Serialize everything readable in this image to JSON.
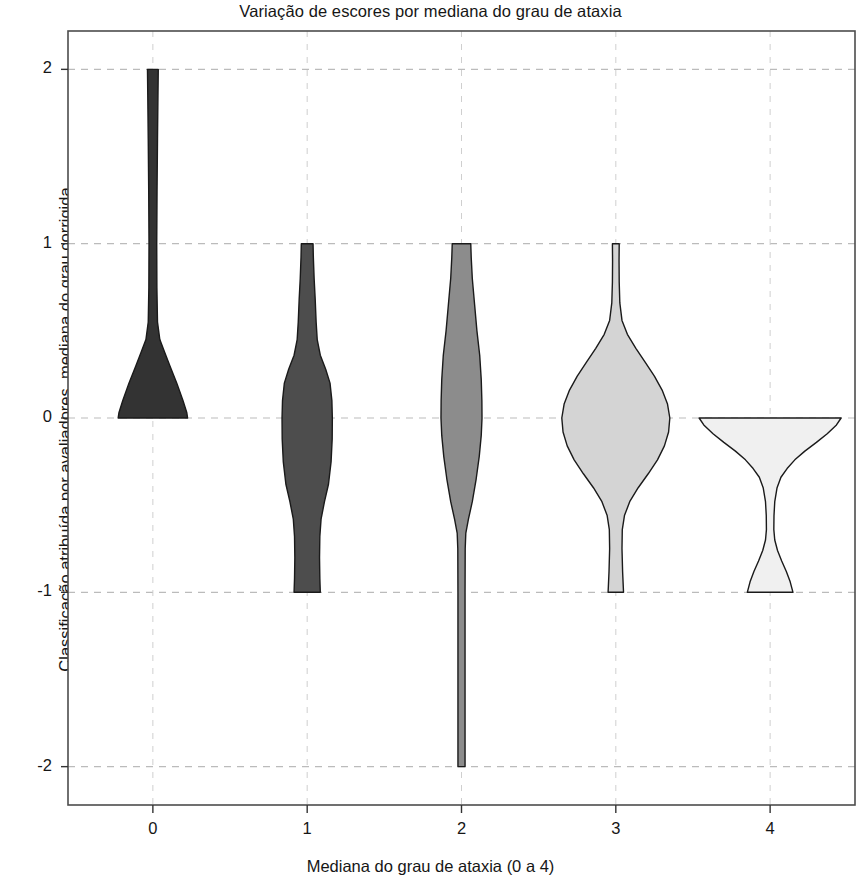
{
  "chart_data": {
    "type": "violin",
    "title": "Variação de escores por mediana do grau de ataxia",
    "xlabel": "Mediana do grau de ataxia (0 a 4)",
    "ylabel": "Classificação atribuída por avaliadores, mediana do grau corrigida",
    "categories": [
      "0",
      "1",
      "2",
      "3",
      "4"
    ],
    "x_tick_labels": [
      "0",
      "1",
      "2",
      "3",
      "4"
    ],
    "y_tick_labels": [
      "2",
      "1",
      "0",
      "-1",
      "-2"
    ],
    "y_tick_values": [
      2,
      1,
      0,
      -1,
      -2
    ],
    "xlim": [
      -0.55,
      4.55
    ],
    "ylim": [
      -2.22,
      2.22
    ],
    "grid": true,
    "grid_style": "dashed",
    "legend": "none",
    "series": [
      {
        "name": "Mediana 0",
        "category": "0",
        "center_x": 0,
        "fill_color": "#333333",
        "edge_color": "#1a1a1a",
        "data_min": 0,
        "data_max": 2,
        "median": 0,
        "density": [
          {
            "y": 2.0,
            "halfwidth": 0.035
          },
          {
            "y": 1.85,
            "halfwidth": 0.033
          },
          {
            "y": 1.6,
            "halfwidth": 0.03
          },
          {
            "y": 1.3,
            "halfwidth": 0.027
          },
          {
            "y": 1.0,
            "halfwidth": 0.025
          },
          {
            "y": 0.75,
            "halfwidth": 0.026
          },
          {
            "y": 0.55,
            "halfwidth": 0.03
          },
          {
            "y": 0.45,
            "halfwidth": 0.045
          },
          {
            "y": 0.38,
            "halfwidth": 0.075
          },
          {
            "y": 0.3,
            "halfwidth": 0.11
          },
          {
            "y": 0.2,
            "halfwidth": 0.155
          },
          {
            "y": 0.1,
            "halfwidth": 0.195
          },
          {
            "y": 0.03,
            "halfwidth": 0.22
          },
          {
            "y": 0.0,
            "halfwidth": 0.225
          }
        ]
      },
      {
        "name": "Mediana 1",
        "category": "1",
        "center_x": 1,
        "fill_color": "#4d4d4d",
        "edge_color": "#1a1a1a",
        "data_min": -1,
        "data_max": 1,
        "median": -0.1,
        "density": [
          {
            "y": 1.0,
            "halfwidth": 0.038
          },
          {
            "y": 0.92,
            "halfwidth": 0.04
          },
          {
            "y": 0.8,
            "halfwidth": 0.045
          },
          {
            "y": 0.68,
            "halfwidth": 0.052
          },
          {
            "y": 0.55,
            "halfwidth": 0.058
          },
          {
            "y": 0.45,
            "halfwidth": 0.065
          },
          {
            "y": 0.36,
            "halfwidth": 0.085
          },
          {
            "y": 0.28,
            "halfwidth": 0.12
          },
          {
            "y": 0.2,
            "halfwidth": 0.148
          },
          {
            "y": 0.1,
            "halfwidth": 0.16
          },
          {
            "y": 0.0,
            "halfwidth": 0.163
          },
          {
            "y": -0.12,
            "halfwidth": 0.162
          },
          {
            "y": -0.25,
            "halfwidth": 0.155
          },
          {
            "y": -0.38,
            "halfwidth": 0.138
          },
          {
            "y": -0.48,
            "halfwidth": 0.112
          },
          {
            "y": -0.58,
            "halfwidth": 0.09
          },
          {
            "y": -0.68,
            "halfwidth": 0.082
          },
          {
            "y": -0.8,
            "halfwidth": 0.08
          },
          {
            "y": -0.92,
            "halfwidth": 0.082
          },
          {
            "y": -1.0,
            "halfwidth": 0.085
          }
        ]
      },
      {
        "name": "Mediana 2",
        "category": "2",
        "center_x": 2,
        "fill_color": "#8c8c8c",
        "edge_color": "#1a1a1a",
        "data_min": -2,
        "data_max": 1,
        "median": 0,
        "density": [
          {
            "y": 1.0,
            "halfwidth": 0.06
          },
          {
            "y": 0.92,
            "halfwidth": 0.063
          },
          {
            "y": 0.8,
            "halfwidth": 0.07
          },
          {
            "y": 0.65,
            "halfwidth": 0.085
          },
          {
            "y": 0.5,
            "halfwidth": 0.1
          },
          {
            "y": 0.36,
            "halfwidth": 0.118
          },
          {
            "y": 0.22,
            "halfwidth": 0.128
          },
          {
            "y": 0.1,
            "halfwidth": 0.132
          },
          {
            "y": 0.0,
            "halfwidth": 0.133
          },
          {
            "y": -0.1,
            "halfwidth": 0.128
          },
          {
            "y": -0.22,
            "halfwidth": 0.115
          },
          {
            "y": -0.35,
            "halfwidth": 0.095
          },
          {
            "y": -0.48,
            "halfwidth": 0.07
          },
          {
            "y": -0.58,
            "halfwidth": 0.045
          },
          {
            "y": -0.66,
            "halfwidth": 0.028
          },
          {
            "y": -0.75,
            "halfwidth": 0.024
          },
          {
            "y": -1.0,
            "halfwidth": 0.023
          },
          {
            "y": -1.4,
            "halfwidth": 0.023
          },
          {
            "y": -1.8,
            "halfwidth": 0.023
          },
          {
            "y": -2.0,
            "halfwidth": 0.023
          }
        ]
      },
      {
        "name": "Mediana 3",
        "category": "3",
        "center_x": 3,
        "fill_color": "#d4d4d4",
        "edge_color": "#1a1a1a",
        "data_min": -1,
        "data_max": 1,
        "median": 0,
        "density": [
          {
            "y": 1.0,
            "halfwidth": 0.022
          },
          {
            "y": 0.9,
            "halfwidth": 0.021
          },
          {
            "y": 0.78,
            "halfwidth": 0.022
          },
          {
            "y": 0.66,
            "halfwidth": 0.026
          },
          {
            "y": 0.56,
            "halfwidth": 0.04
          },
          {
            "y": 0.48,
            "halfwidth": 0.075
          },
          {
            "y": 0.4,
            "halfwidth": 0.13
          },
          {
            "y": 0.32,
            "halfwidth": 0.19
          },
          {
            "y": 0.24,
            "halfwidth": 0.25
          },
          {
            "y": 0.16,
            "halfwidth": 0.3
          },
          {
            "y": 0.08,
            "halfwidth": 0.335
          },
          {
            "y": 0.0,
            "halfwidth": 0.35
          },
          {
            "y": -0.08,
            "halfwidth": 0.342
          },
          {
            "y": -0.16,
            "halfwidth": 0.315
          },
          {
            "y": -0.24,
            "halfwidth": 0.27
          },
          {
            "y": -0.32,
            "halfwidth": 0.21
          },
          {
            "y": -0.4,
            "halfwidth": 0.145
          },
          {
            "y": -0.48,
            "halfwidth": 0.09
          },
          {
            "y": -0.56,
            "halfwidth": 0.056
          },
          {
            "y": -0.64,
            "halfwidth": 0.042
          },
          {
            "y": -0.75,
            "halfwidth": 0.04
          },
          {
            "y": -0.88,
            "halfwidth": 0.044
          },
          {
            "y": -1.0,
            "halfwidth": 0.05
          }
        ]
      },
      {
        "name": "Mediana 4",
        "category": "4",
        "center_x": 4,
        "fill_color": "#f0f0f0",
        "edge_color": "#1a1a1a",
        "data_min": -1,
        "data_max": 0,
        "median": 0,
        "density": [
          {
            "y": 0.0,
            "halfwidth": 0.46
          },
          {
            "y": -0.04,
            "halfwidth": 0.43
          },
          {
            "y": -0.09,
            "halfwidth": 0.37
          },
          {
            "y": -0.14,
            "halfwidth": 0.3
          },
          {
            "y": -0.19,
            "halfwidth": 0.225
          },
          {
            "y": -0.24,
            "halfwidth": 0.16
          },
          {
            "y": -0.29,
            "halfwidth": 0.11
          },
          {
            "y": -0.34,
            "halfwidth": 0.07
          },
          {
            "y": -0.4,
            "halfwidth": 0.045
          },
          {
            "y": -0.48,
            "halfwidth": 0.03
          },
          {
            "y": -0.56,
            "halfwidth": 0.025
          },
          {
            "y": -0.64,
            "halfwidth": 0.024
          },
          {
            "y": -0.7,
            "halfwidth": 0.03
          },
          {
            "y": -0.76,
            "halfwidth": 0.048
          },
          {
            "y": -0.82,
            "halfwidth": 0.075
          },
          {
            "y": -0.88,
            "halfwidth": 0.105
          },
          {
            "y": -0.94,
            "halfwidth": 0.13
          },
          {
            "y": -1.0,
            "halfwidth": 0.148
          }
        ]
      }
    ]
  },
  "axes": {
    "frame_color": "#4d4d4d",
    "grid_color": "#bbbbbb",
    "background": "#ffffff"
  }
}
